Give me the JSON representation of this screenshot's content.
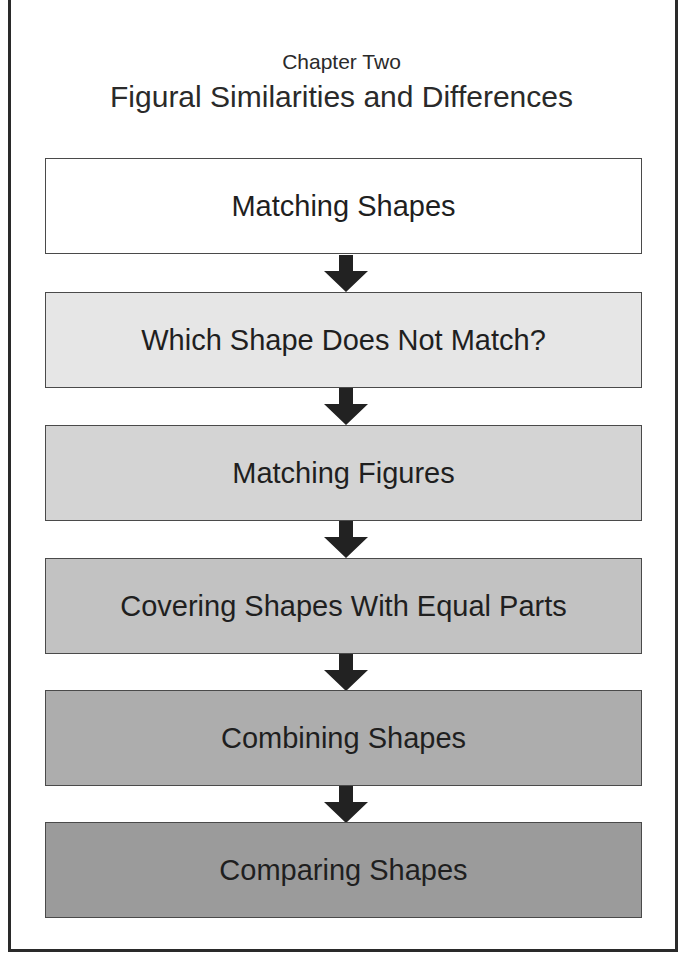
{
  "header": {
    "subtitle": "Chapter Two",
    "title": "Figural Similarities and Differences"
  },
  "flow": {
    "steps": [
      {
        "label": "Matching Shapes",
        "fill": "#ffffff"
      },
      {
        "label": "Which Shape Does Not Match?",
        "fill": "#e6e6e6"
      },
      {
        "label": "Matching Figures",
        "fill": "#d4d4d4"
      },
      {
        "label": "Covering Shapes With Equal Parts",
        "fill": "#c2c2c2"
      },
      {
        "label": "Combining Shapes",
        "fill": "#adadad"
      },
      {
        "label": "Comparing Shapes",
        "fill": "#9b9b9b"
      }
    ],
    "arrow_color": "#222222",
    "arrow_icon": "down-arrow-icon"
  }
}
